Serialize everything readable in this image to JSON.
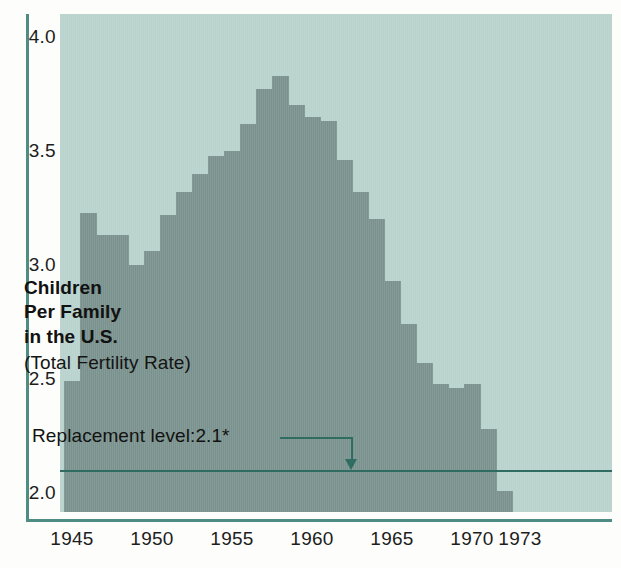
{
  "figure": {
    "background_color": "#bcd5cf",
    "bar_color": "#7d9591",
    "axis_color": "#4e8c84",
    "annotation_color": "#2f6d63"
  },
  "labels": {
    "title_line1": "Children",
    "title_line2": "Per Family",
    "title_line3": "in the U.S.",
    "subtitle": "(Total Fertility Rate)",
    "replacement_annotation": "Replacement level:2.1*"
  },
  "chart_data": {
    "type": "bar",
    "title": "Children Per Family in the U.S.",
    "subtitle": "(Total Fertility Rate)",
    "xlabel": "",
    "ylabel": "",
    "ylim": [
      2.0,
      4.0
    ],
    "xlim": [
      1945,
      1974
    ],
    "grid": false,
    "legend": "none",
    "ytick_labels": [
      "4.0",
      "3.5",
      "3.0",
      "2.5",
      "2.0"
    ],
    "ytick_values": [
      4.0,
      3.5,
      3.0,
      2.5,
      2.0
    ],
    "xtick_labels": [
      "1945",
      "1950",
      "1955",
      "1960",
      "1965",
      "1970",
      "1973"
    ],
    "xtick_values": [
      1945,
      1950,
      1955,
      1960,
      1965,
      1970,
      1973
    ],
    "categories": [
      1945,
      1946,
      1947,
      1948,
      1949,
      1950,
      1951,
      1952,
      1953,
      1954,
      1955,
      1956,
      1957,
      1958,
      1959,
      1960,
      1961,
      1962,
      1963,
      1964,
      1965,
      1966,
      1967,
      1968,
      1969,
      1970,
      1971,
      1972,
      1973
    ],
    "values": [
      2.49,
      3.23,
      3.13,
      3.13,
      3.0,
      3.06,
      3.22,
      3.32,
      3.4,
      3.48,
      3.5,
      3.62,
      3.77,
      3.83,
      3.7,
      3.65,
      3.63,
      3.46,
      3.32,
      3.2,
      2.93,
      2.74,
      2.57,
      2.48,
      2.46,
      2.48,
      2.28,
      2.01,
      1.88
    ],
    "annotations": [
      {
        "text": "Replacement level:2.1*",
        "value": 2.1,
        "type": "hline-with-arrow"
      }
    ]
  }
}
